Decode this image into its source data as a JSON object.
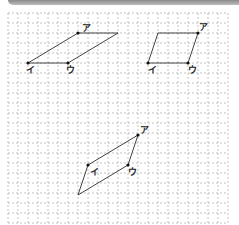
{
  "grid": {
    "x0": 8,
    "y0": 13,
    "cols": 22,
    "rows": 21,
    "step": 10,
    "color": "#9a9a9a"
  },
  "figures": [
    {
      "name": "figure-1",
      "polygon": [
        [
          78,
          33
        ],
        [
          118,
          33
        ],
        [
          68,
          63
        ],
        [
          28,
          63
        ]
      ],
      "points": [
        {
          "label": "ア",
          "x": 78,
          "y": 33,
          "lx": 82,
          "ly": 31
        },
        {
          "label": "イ",
          "x": 28,
          "y": 63,
          "lx": 26,
          "ly": 73
        },
        {
          "label": "ウ",
          "x": 68,
          "y": 63,
          "lx": 66,
          "ly": 73
        }
      ]
    },
    {
      "name": "figure-2",
      "polygon": [
        [
          158,
          33
        ],
        [
          198,
          33
        ],
        [
          188,
          63
        ],
        [
          148,
          63
        ]
      ],
      "points": [
        {
          "label": "ア",
          "x": 198,
          "y": 33,
          "lx": 199,
          "ly": 30
        },
        {
          "label": "イ",
          "x": 148,
          "y": 63,
          "lx": 148,
          "ly": 73
        },
        {
          "label": "ウ",
          "x": 188,
          "y": 63,
          "lx": 188,
          "ly": 73
        }
      ]
    },
    {
      "name": "figure-3",
      "polygon": [
        [
          138,
          135
        ],
        [
          128,
          165
        ],
        [
          78,
          195
        ],
        [
          88,
          165
        ]
      ],
      "points": [
        {
          "label": "ア",
          "x": 138,
          "y": 135,
          "lx": 140,
          "ly": 133
        },
        {
          "label": "イ",
          "x": 88,
          "y": 165,
          "lx": 90,
          "ly": 175
        },
        {
          "label": "ウ",
          "x": 128,
          "y": 165,
          "lx": 128,
          "ly": 175
        }
      ]
    }
  ]
}
